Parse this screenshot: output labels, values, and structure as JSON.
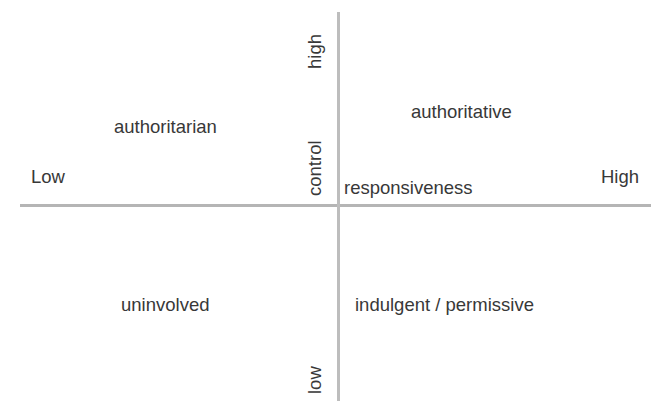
{
  "diagram": {
    "background_color": "#ffffff",
    "axis_color": "#b5b5b5",
    "text_color": "#383838",
    "axes": {
      "horizontal": {
        "name": "responsiveness",
        "low_end_label": "Low",
        "high_end_label": "High"
      },
      "vertical": {
        "name": "control",
        "high_end_label": "high",
        "low_end_label": "low"
      }
    },
    "quadrants": [
      {
        "position": "top-left",
        "label": "authoritarian"
      },
      {
        "position": "top-right",
        "label": "authoritative"
      },
      {
        "position": "bottom-left",
        "label": "uninvolved"
      },
      {
        "position": "bottom-right",
        "label": "indulgent / permissive"
      }
    ]
  },
  "chart_data": {
    "type": "scatter",
    "title": "",
    "xlabel": "responsiveness",
    "ylabel": "control",
    "xlim": [
      "Low",
      "High"
    ],
    "ylim": [
      "low",
      "high"
    ],
    "grid": false,
    "legend": "none",
    "annotations": [
      {
        "text": "authoritarian",
        "x": "low",
        "y": "high"
      },
      {
        "text": "authoritative",
        "x": "high",
        "y": "high"
      },
      {
        "text": "uninvolved",
        "x": "low",
        "y": "low"
      },
      {
        "text": "indulgent / permissive",
        "x": "high",
        "y": "low"
      }
    ]
  }
}
